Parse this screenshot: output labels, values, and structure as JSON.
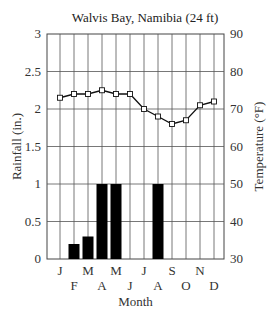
{
  "chart_data": {
    "type": "bar+line",
    "title": "Walvis Bay, Namibia (24 ft)",
    "xlabel": "Month",
    "ylabel_left": "Rainfall (in.)",
    "ylabel_right": "Temperature (°F)",
    "categories": [
      "J",
      "F",
      "M",
      "A",
      "M",
      "J",
      "J",
      "A",
      "S",
      "O",
      "N",
      "D"
    ],
    "ylim_left": [
      0,
      3
    ],
    "ylim_right": [
      30,
      90
    ],
    "left_ticks": [
      "0",
      "0.5",
      "1",
      "1.5",
      "2",
      "2.5",
      "3"
    ],
    "right_ticks": [
      "30",
      "40",
      "50",
      "60",
      "70",
      "80",
      "90"
    ],
    "grid": true,
    "series": [
      {
        "name": "Rainfall",
        "type": "bar",
        "axis": "left",
        "values": [
          0,
          0.2,
          0.3,
          1,
          1,
          0,
          0,
          1,
          0,
          0,
          0,
          0
        ]
      },
      {
        "name": "Temperature",
        "type": "line",
        "axis": "right",
        "marker": "square",
        "values": [
          73,
          74,
          74,
          75,
          74,
          74,
          70,
          68,
          66,
          67,
          71,
          72
        ]
      }
    ]
  }
}
